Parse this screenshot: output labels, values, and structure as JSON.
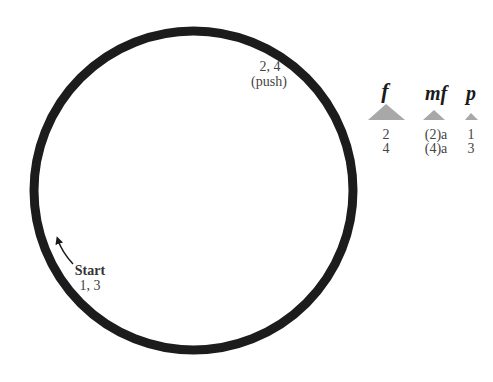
{
  "diagram": {
    "ring_color": "#1c1c1c",
    "triangle_color": "#a8a8a8",
    "top_label": {
      "numbers": "2, 4",
      "action": "(push)"
    },
    "start_label": {
      "title": "Start",
      "numbers": "1, 3"
    },
    "dynamics": [
      {
        "symbol": "f",
        "row1": "2",
        "row2": "4"
      },
      {
        "symbol": "mf",
        "row1": "(2)a",
        "row2": "(4)a"
      },
      {
        "symbol": "p",
        "row1": "1",
        "row2": "3"
      }
    ]
  }
}
